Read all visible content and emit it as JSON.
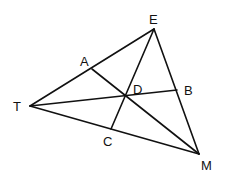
{
  "diagram": {
    "type": "geometry",
    "line_color": "#111111",
    "background": "#ffffff",
    "points": {
      "E": {
        "label": "E",
        "x": 154,
        "y": 29,
        "label_x": 149,
        "label_y": 24
      },
      "T": {
        "label": "T",
        "x": 30,
        "y": 106,
        "label_x": 13,
        "label_y": 111
      },
      "M": {
        "label": "M",
        "x": 199,
        "y": 154,
        "label_x": 201,
        "label_y": 170
      },
      "A": {
        "label": "A",
        "x": 92,
        "y": 69,
        "label_x": 80,
        "label_y": 66
      },
      "B": {
        "label": "B",
        "x": 177,
        "y": 90,
        "label_x": 184,
        "label_y": 95
      },
      "C": {
        "label": "C",
        "x": 111,
        "y": 129,
        "label_x": 103,
        "label_y": 146
      },
      "D": {
        "label": "D",
        "x": 125,
        "y": 97,
        "label_x": 133,
        "label_y": 94
      }
    },
    "segments": [
      {
        "name": "side-TE",
        "from": "T",
        "to": "E"
      },
      {
        "name": "side-EM",
        "from": "E",
        "to": "M"
      },
      {
        "name": "side-TM",
        "from": "T",
        "to": "M"
      },
      {
        "name": "cevian-TB",
        "from": "T",
        "to": "B"
      },
      {
        "name": "cevian-EC",
        "from": "E",
        "to": "C"
      },
      {
        "name": "cevian-AM",
        "from": "A",
        "to": "M"
      }
    ]
  }
}
